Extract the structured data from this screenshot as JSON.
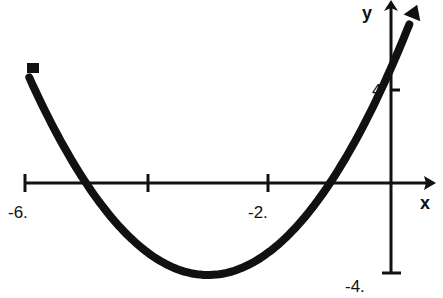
{
  "chart_data": {
    "type": "line",
    "title": "",
    "xlabel": "x",
    "ylabel": "y",
    "function": "y = x^2 + 6x + 5",
    "xlim": [
      -6,
      0.4
    ],
    "ylim": [
      -4,
      7.5
    ],
    "x_ticks": [
      -6,
      -4,
      -2,
      0
    ],
    "x_tick_labels": [
      "-6.",
      "",
      "-2.",
      ""
    ],
    "y_ticks": [
      -4,
      4
    ],
    "y_tick_labels": [
      "-4.",
      "4"
    ],
    "grid": false,
    "legend": null,
    "series": [
      {
        "name": "parabola",
        "x": [
          -6,
          -5.5,
          -5,
          -4.5,
          -4,
          -3.5,
          -3,
          -2.5,
          -2,
          -1.5,
          -1,
          -0.5,
          0,
          0.3
        ],
        "values": [
          5,
          2.25,
          0,
          -1.75,
          -3,
          -3.75,
          -4,
          -3.75,
          -3,
          -1.75,
          0,
          2.25,
          5,
          6.89
        ]
      }
    ],
    "annotations": {
      "vertex": [
        -3,
        -4
      ],
      "roots": [
        -5,
        -1
      ],
      "y_intercept": 5
    }
  },
  "labels": {
    "x_axis": "x",
    "y_axis": "y",
    "tick_neg6": "-6.",
    "tick_neg2": "-2.",
    "tick_y4": "4",
    "tick_yneg4": "-4."
  }
}
